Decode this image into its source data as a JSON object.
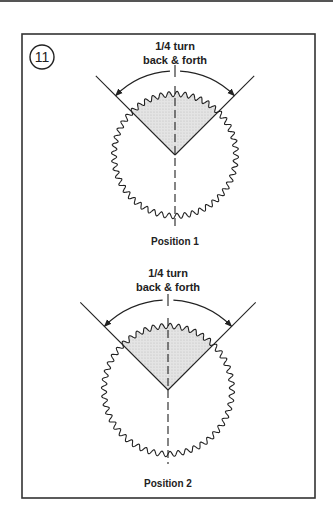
{
  "figure": {
    "step_number": "11",
    "diagrams": [
      {
        "id": "position-1",
        "annotation_line1": "1/4 turn",
        "annotation_line2": "back & forth",
        "caption": "Position 1"
      },
      {
        "id": "position-2",
        "annotation_line1": "1/4 turn",
        "annotation_line2": "back & forth",
        "caption": "Position 2"
      }
    ]
  },
  "colors": {
    "stroke": "#222222",
    "sector_fill": "#dcdcdc",
    "background": "#ffffff"
  }
}
